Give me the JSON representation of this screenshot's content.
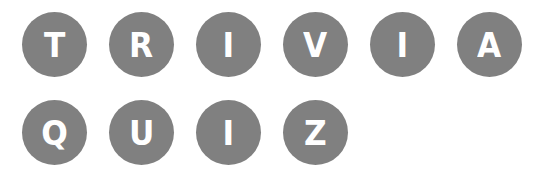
{
  "colors": {
    "tile_background": "#808080",
    "letter": "#ffffff",
    "page_background": "#ffffff"
  },
  "rows": [
    {
      "word": "TRIVIA",
      "letters": [
        "T",
        "R",
        "I",
        "V",
        "I",
        "A"
      ]
    },
    {
      "word": "QUIZ",
      "letters": [
        "Q",
        "U",
        "I",
        "Z"
      ]
    }
  ]
}
